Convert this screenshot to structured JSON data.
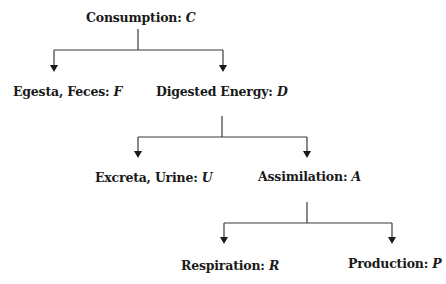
{
  "diagram": {
    "type": "tree",
    "nodes": [
      {
        "id": "C",
        "name": "Consumption: ",
        "symbol": "C",
        "parent": null
      },
      {
        "id": "F",
        "name": "Egesta, Feces: ",
        "symbol": "F",
        "parent": "C"
      },
      {
        "id": "D",
        "name": "Digested Energy: ",
        "symbol": "D",
        "parent": "C"
      },
      {
        "id": "U",
        "name": "Excreta, Urine: ",
        "symbol": "U",
        "parent": "D"
      },
      {
        "id": "A",
        "name": "Assimilation: ",
        "symbol": "A",
        "parent": "D"
      },
      {
        "id": "R",
        "name": "Respiration: ",
        "symbol": "R",
        "parent": "A"
      },
      {
        "id": "P",
        "name": "Production: ",
        "symbol": "P",
        "parent": "A"
      }
    ],
    "edges": [
      {
        "from": "C",
        "to": "F"
      },
      {
        "from": "C",
        "to": "D"
      },
      {
        "from": "D",
        "to": "U"
      },
      {
        "from": "D",
        "to": "A"
      },
      {
        "from": "A",
        "to": "R"
      },
      {
        "from": "A",
        "to": "P"
      }
    ],
    "colors": {
      "line": "#3a3a3a",
      "text": "#1a1a1a",
      "background": "#ffffff"
    }
  }
}
